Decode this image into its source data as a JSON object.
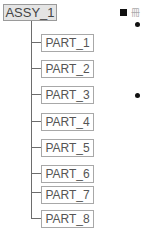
{
  "diagram": {
    "root": {
      "label": "ASSY_1"
    },
    "children": [
      {
        "label": "PART_1"
      },
      {
        "label": "PART_2"
      },
      {
        "label": "PART_3"
      },
      {
        "label": "PART_4"
      },
      {
        "label": "PART_5"
      },
      {
        "label": "PART_6"
      },
      {
        "label": "PART_7"
      },
      {
        "label": "PART_8"
      }
    ]
  },
  "side_panel": {
    "heading_marker": "square-bullet",
    "heading_text_fragment": "■",
    "bullets": 2
  }
}
